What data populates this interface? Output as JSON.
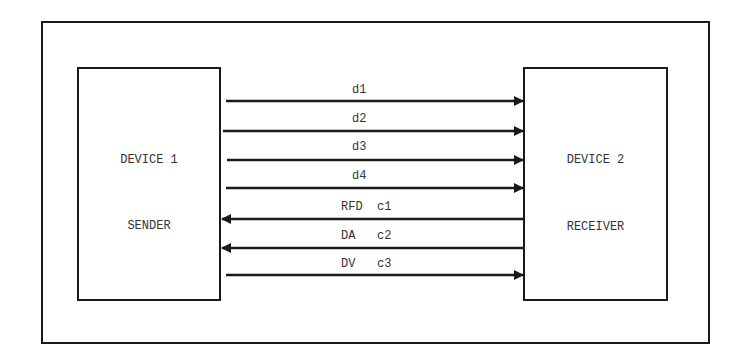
{
  "diagram": {
    "device1": {
      "name": "DEVICE 1",
      "role": "SENDER"
    },
    "device2": {
      "name": "DEVICE 2",
      "role": "RECEIVER"
    },
    "signals": [
      {
        "label": "d1",
        "direction": "to-receiver"
      },
      {
        "label": "d2",
        "direction": "to-receiver"
      },
      {
        "label": "d3",
        "direction": "to-receiver"
      },
      {
        "label": "d4",
        "direction": "to-receiver"
      },
      {
        "label": "RFD  c1",
        "direction": "to-sender"
      },
      {
        "label": "DA   c2",
        "direction": "to-sender"
      },
      {
        "label": "DV   c3",
        "direction": "to-receiver"
      }
    ],
    "line_color": "#1a1a1a"
  }
}
